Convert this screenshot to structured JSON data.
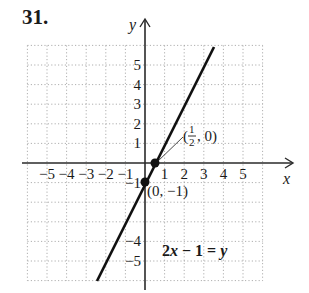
{
  "problem": {
    "number": "31."
  },
  "chart_data": {
    "type": "line",
    "title": "",
    "xlabel": "x",
    "ylabel": "y",
    "xlim": [
      -6,
      6
    ],
    "ylim": [
      -6,
      6
    ],
    "grid": true,
    "x_ticks": [
      "-5",
      "-4",
      "-3",
      "-2",
      "-1",
      "1",
      "2",
      "3",
      "4",
      "5"
    ],
    "y_ticks": [
      "5",
      "4",
      "3",
      "2",
      "1",
      "-1",
      "-4",
      "-5"
    ],
    "series": [
      {
        "name": "2x − 1 = y",
        "equation": "y = 2x - 1",
        "slope": 2,
        "intercept": -1,
        "x": [
          -2.5,
          3.5
        ],
        "y": [
          -6,
          6
        ]
      }
    ],
    "points": [
      {
        "x": 0.5,
        "y": 0,
        "label": "(1/2, 0)"
      },
      {
        "x": 0,
        "y": -1,
        "label": "(0, −1)"
      }
    ],
    "annotations": [
      {
        "text": "2x − 1 = y",
        "position": "lower right"
      }
    ]
  },
  "labels": {
    "x_axis": "x",
    "y_axis": "y",
    "point1_open": "(",
    "point1_num": "1",
    "point1_den": "2",
    "point1_close": ", 0)",
    "point2": "(0, −1)",
    "equation_coef": "2",
    "equation_x": "x",
    "equation_mid": " − 1 = ",
    "equation_y": "y"
  },
  "colors": {
    "axis": "#2a2a2a",
    "grid": "#9a9a9a",
    "line": "#111111"
  }
}
